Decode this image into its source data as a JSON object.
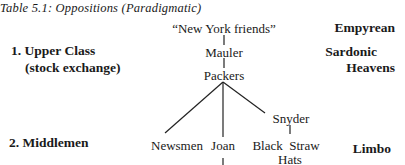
{
  "caption": "Table 5.1: Oppositions (Paradigmatic)",
  "levels": [
    {
      "number": "1.",
      "label": "Upper Class",
      "sublabel": "(stock exchange)"
    },
    {
      "number": "2.",
      "label": "Middlemen"
    }
  ],
  "realms": [
    {
      "label": "Empyrean"
    },
    {
      "label_line1": "Sardonic",
      "label_line2": "Heavens"
    },
    {
      "label": "Limbo"
    }
  ],
  "tree": {
    "root": "“New York friends”",
    "level1": [
      "Mauler",
      "Packers"
    ],
    "packers_children": [
      "Newsmen",
      "Joan",
      "Snyder"
    ],
    "snyder_child_line1": "Black  Straw",
    "snyder_child_line2": "Hats"
  }
}
